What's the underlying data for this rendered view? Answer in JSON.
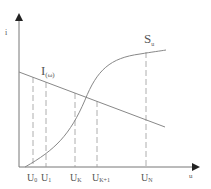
{
  "diagram": {
    "y_axis_label": "i",
    "x_axis_label": "u",
    "line_label_main": "I",
    "line_label_sub": "(ω)",
    "curve_label_main": "S",
    "curve_label_sub": "u",
    "ticks": [
      {
        "main": "U",
        "sub": "0",
        "x": 33
      },
      {
        "main": "U",
        "sub": "1",
        "x": 46
      },
      {
        "main": "U",
        "sub": "K",
        "x": 75
      },
      {
        "main": "U",
        "sub": "K+1",
        "x": 97
      },
      {
        "main": "U",
        "sub": "N",
        "x": 146
      }
    ],
    "colors": {
      "line": "#888888",
      "axis": "#666666",
      "text": "#555555"
    }
  }
}
